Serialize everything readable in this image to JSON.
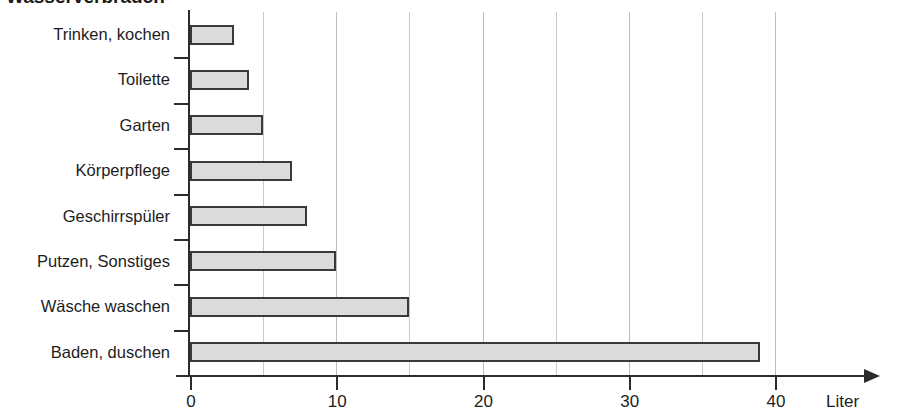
{
  "chart_data": {
    "type": "bar",
    "orientation": "horizontal",
    "title": "",
    "xlabel": "Liter",
    "ylabel": "",
    "xlim": [
      0,
      40
    ],
    "xticks": [
      0,
      10,
      20,
      30,
      40
    ],
    "xtick_labels": [
      "0",
      "10",
      "20",
      "30",
      "40"
    ],
    "gridlines": [
      0,
      5,
      10,
      15,
      20,
      25,
      30,
      35,
      40
    ],
    "grid": true,
    "legend": false,
    "categories": [
      "Trinken, kochen",
      "Toilette",
      "Garten",
      "Körperpflege",
      "Geschirrspüler",
      "Putzen, Sonstiges",
      "Wäsche waschen",
      "Baden, duschen"
    ],
    "values": [
      3,
      4,
      5,
      7,
      8,
      10,
      15,
      39
    ],
    "bar_fill": "#dcdcdc",
    "bar_border": "#3a3a3a",
    "axis_color": "#2b2b2b",
    "grid_color": "#c9c9c9"
  },
  "axis": {
    "unit_label": "Liter"
  },
  "header": {
    "cut_title": "Wasserverbrauch"
  }
}
